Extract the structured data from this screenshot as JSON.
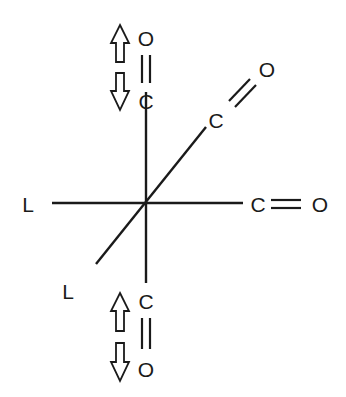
{
  "diagram": {
    "title": "",
    "center_label": "",
    "ligands": {
      "axial_left": "L",
      "diagonal_lower_left": "L"
    },
    "carbonyls": {
      "top": {
        "carbon": "C",
        "oxygen": "O",
        "bond": "double"
      },
      "diagonal_upper_right": {
        "carbon": "C",
        "oxygen": "O",
        "bond": "double"
      },
      "right": {
        "carbon": "C",
        "oxygen": "O",
        "bond": "double"
      },
      "bottom": {
        "carbon": "C",
        "oxygen": "O",
        "bond": "double"
      }
    },
    "arrows": {
      "top": [
        "arrow-up",
        "arrow-down"
      ],
      "bottom": [
        "arrow-up",
        "arrow-down"
      ]
    },
    "colors": {
      "ink": "#1a1a1a",
      "background": "#ffffff"
    }
  }
}
